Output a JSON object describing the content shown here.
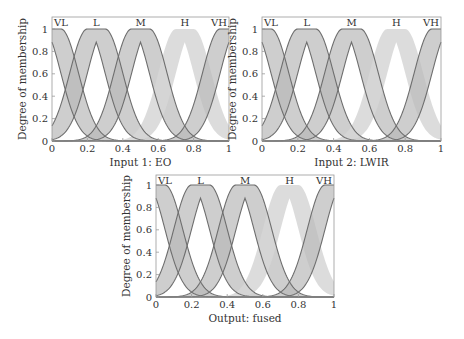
{
  "chart_data": [
    {
      "type": "area",
      "title": "",
      "xlabel": "Input 1: EO",
      "ylabel": "Degree of membership",
      "xlim": [
        0,
        1
      ],
      "ylim": [
        0,
        1
      ],
      "xticks": [
        "0",
        "0.2",
        "0.4",
        "0.6",
        "0.8",
        "1"
      ],
      "yticks": [
        "0",
        "0.2",
        "0.4",
        "0.6",
        "0.8",
        "1"
      ],
      "grid": false,
      "mf_type": "interval type-2 gaussian, uncertain mean",
      "series": [
        {
          "name": "VL",
          "center": 0.0,
          "mean_spread": 0.05,
          "sigma": 0.1,
          "upper_peak": 1,
          "lower_peak": 0.88
        },
        {
          "name": "L",
          "center": 0.25,
          "mean_spread": 0.05,
          "sigma": 0.1,
          "upper_peak": 1,
          "lower_peak": 0.88
        },
        {
          "name": "M",
          "center": 0.5,
          "mean_spread": 0.05,
          "sigma": 0.1,
          "upper_peak": 1,
          "lower_peak": 0.88
        },
        {
          "name": "H",
          "center": 0.75,
          "mean_spread": 0.05,
          "sigma": 0.1,
          "upper_peak": 1,
          "lower_peak": 0.88
        },
        {
          "name": "VH",
          "center": 1.0,
          "mean_spread": 0.05,
          "sigma": 0.1,
          "upper_peak": 1,
          "lower_peak": 0.88
        }
      ]
    },
    {
      "type": "area",
      "title": "",
      "xlabel": "Input 2: LWIR",
      "ylabel": "Degree of membership",
      "xlim": [
        0,
        1
      ],
      "ylim": [
        0,
        1
      ],
      "xticks": [
        "0",
        "0.2",
        "0.4",
        "0.6",
        "0.8",
        "1"
      ],
      "yticks": [
        "0",
        "0.2",
        "0.4",
        "0.6",
        "0.8",
        "1"
      ],
      "grid": false,
      "mf_type": "interval type-2 gaussian, uncertain mean",
      "series": [
        {
          "name": "VL",
          "center": 0.0,
          "mean_spread": 0.05,
          "sigma": 0.1,
          "upper_peak": 1,
          "lower_peak": 0.88
        },
        {
          "name": "L",
          "center": 0.25,
          "mean_spread": 0.05,
          "sigma": 0.1,
          "upper_peak": 1,
          "lower_peak": 0.88
        },
        {
          "name": "M",
          "center": 0.5,
          "mean_spread": 0.05,
          "sigma": 0.1,
          "upper_peak": 1,
          "lower_peak": 0.88
        },
        {
          "name": "H",
          "center": 0.75,
          "mean_spread": 0.05,
          "sigma": 0.1,
          "upper_peak": 1,
          "lower_peak": 0.88
        },
        {
          "name": "VH",
          "center": 1.0,
          "mean_spread": 0.05,
          "sigma": 0.1,
          "upper_peak": 1,
          "lower_peak": 0.88
        }
      ]
    },
    {
      "type": "area",
      "title": "",
      "xlabel": "Output: fused",
      "ylabel": "Degree of membership",
      "xlim": [
        0,
        1
      ],
      "ylim": [
        0,
        1
      ],
      "xticks": [
        "0",
        "0.2",
        "0.4",
        "0.6",
        "0.8",
        "1"
      ],
      "yticks": [
        "0",
        "0.2",
        "0.4",
        "0.6",
        "0.8",
        "1"
      ],
      "grid": false,
      "mf_type": "interval type-2 gaussian, uncertain mean",
      "series": [
        {
          "name": "VL",
          "center": 0.0,
          "mean_spread": 0.05,
          "sigma": 0.1,
          "upper_peak": 1,
          "lower_peak": 0.88
        },
        {
          "name": "L",
          "center": 0.25,
          "mean_spread": 0.05,
          "sigma": 0.1,
          "upper_peak": 1,
          "lower_peak": 0.88
        },
        {
          "name": "M",
          "center": 0.5,
          "mean_spread": 0.05,
          "sigma": 0.1,
          "upper_peak": 1,
          "lower_peak": 0.88
        },
        {
          "name": "H",
          "center": 0.75,
          "mean_spread": 0.05,
          "sigma": 0.1,
          "upper_peak": 1,
          "lower_peak": 0.88
        },
        {
          "name": "VH",
          "center": 1.0,
          "mean_spread": 0.05,
          "sigma": 0.1,
          "upper_peak": 1,
          "lower_peak": 0.88
        }
      ]
    }
  ],
  "plots": [
    {
      "id": "input1",
      "xlabel": "Input 1: EO",
      "ylabel": "Degree of membership"
    },
    {
      "id": "input2",
      "xlabel": "Input 2: LWIR",
      "ylabel": "Degree of membership"
    },
    {
      "id": "output",
      "xlabel": "Output: fused",
      "ylabel": "Degree of membership"
    }
  ],
  "labels": [
    "VL",
    "L",
    "M",
    "H",
    "VH"
  ],
  "xticks": [
    "0",
    "0.2",
    "0.4",
    "0.6",
    "0.8",
    "1"
  ],
  "yticks": [
    "0",
    "0.2",
    "0.4",
    "0.6",
    "0.8",
    "1"
  ],
  "colors": {
    "band": "#b9b9b9",
    "band_light": "#d6d6d6",
    "line": "#6e6e6e",
    "axis": "#9a9a9a"
  }
}
